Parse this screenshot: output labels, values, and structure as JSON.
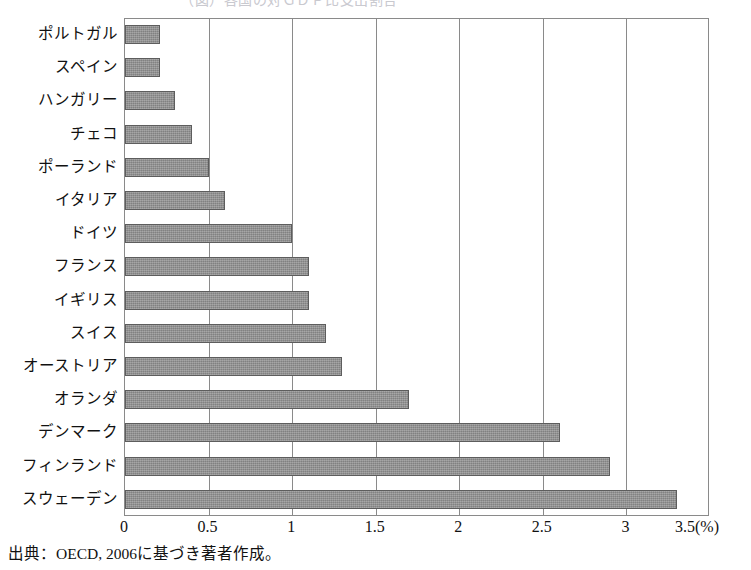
{
  "figure": {
    "title_cropped": "（図）各国の対ＧＤＰ比支出割合",
    "source_note": "出典：OECD, 2006に基づき著者作成。"
  },
  "chart_data": {
    "type": "bar",
    "orientation": "horizontal",
    "title": "",
    "xlabel": "(%)",
    "ylabel": "",
    "xlim": [
      0,
      3.5
    ],
    "xticks": [
      "0",
      "0.5",
      "1",
      "1.5",
      "2",
      "2.5",
      "3",
      "3.5(%)"
    ],
    "xtick_values": [
      0,
      0.5,
      1,
      1.5,
      2,
      2.5,
      3,
      3.5
    ],
    "grid": true,
    "grid_axis": "x",
    "legend": null,
    "bar_color": "#8e8e8e",
    "bar_edge_color": "#5d5d5d",
    "categories": [
      "ポルトガル",
      "スペイン",
      "ハンガリー",
      "チェコ",
      "ポーランド",
      "イタリア",
      "ドイツ",
      "フランス",
      "イギリス",
      "スイス",
      "オーストリア",
      "オランダ",
      "デンマーク",
      "フィンランド",
      "スウェーデン"
    ],
    "values": [
      0.21,
      0.21,
      0.3,
      0.4,
      0.5,
      0.6,
      1.0,
      1.1,
      1.1,
      1.2,
      1.3,
      1.7,
      2.6,
      2.9,
      3.3
    ]
  }
}
